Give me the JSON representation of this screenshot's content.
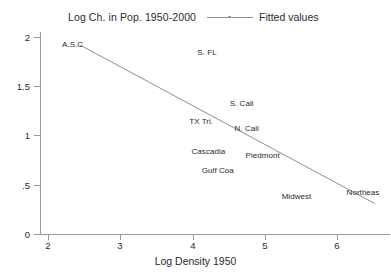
{
  "chart_data": {
    "type": "scatter",
    "title": "Log Ch. in Pop. 1950-2000",
    "xlabel": "Log Density 1950",
    "ylabel": "",
    "xlim": [
      2,
      6.4
    ],
    "ylim": [
      0,
      2.15
    ],
    "grid": false,
    "legend_position": "top-right",
    "legend": [
      {
        "name": "Fitted values",
        "marker": "line-with-dot",
        "color": "#8f8f8f"
      }
    ],
    "xticks": [
      2,
      3,
      4,
      5,
      6
    ],
    "xtick_labels": [
      "2",
      "3",
      "4",
      "5",
      "6"
    ],
    "yticks": [
      0,
      0.5,
      1,
      1.5,
      2
    ],
    "ytick_labels": [
      "0",
      ".5",
      "1",
      "1.5",
      "2"
    ],
    "points": [
      {
        "label": "A.S.C",
        "x": 2.34,
        "y": 1.92
      },
      {
        "label": "S. FL",
        "x": 4.2,
        "y": 1.84
      },
      {
        "label": "S. Cali",
        "x": 4.68,
        "y": 1.32
      },
      {
        "label": "TX Tri.",
        "x": 4.12,
        "y": 1.14
      },
      {
        "label": "N. Cali",
        "x": 4.75,
        "y": 1.07
      },
      {
        "label": "Cascadia",
        "x": 4.22,
        "y": 0.83
      },
      {
        "label": "Piedmont",
        "x": 4.97,
        "y": 0.79
      },
      {
        "label": "Gulf Coa",
        "x": 4.35,
        "y": 0.64
      },
      {
        "label": "Midwest",
        "x": 5.44,
        "y": 0.38
      },
      {
        "label": "Northeas",
        "x": 6.36,
        "y": 0.42
      }
    ],
    "fitted_line": {
      "name": "Fitted values",
      "x_start": 2.44,
      "y_start": 1.92,
      "x_end": 6.52,
      "y_end": 0.31,
      "color": "#8f8f8f"
    }
  }
}
